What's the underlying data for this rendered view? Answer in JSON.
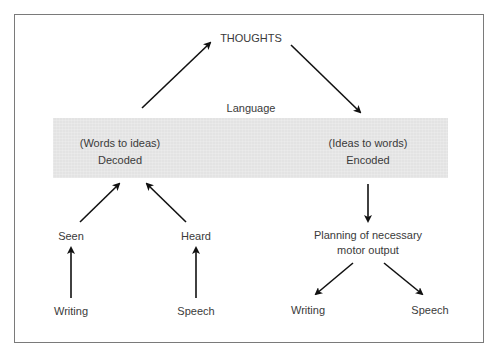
{
  "diagram": {
    "top_node": "THOUGHTS",
    "language_label": "Language",
    "decode": {
      "sub": "(Words to ideas)",
      "label": "Decoded"
    },
    "encode": {
      "sub": "(Ideas to words)",
      "label": "Encoded"
    },
    "inputs": {
      "seen": "Seen",
      "heard": "Heard",
      "writing": "Writing",
      "speech": "Speech"
    },
    "outputs": {
      "planning_line1": "Planning of necessary",
      "planning_line2": "motor output",
      "writing": "Writing",
      "speech": "Speech"
    },
    "colors": {
      "box_fill": "#e3e3e3",
      "text": "#3a3a3a",
      "arrow": "#111111",
      "frame": "#7a7a7a"
    }
  }
}
